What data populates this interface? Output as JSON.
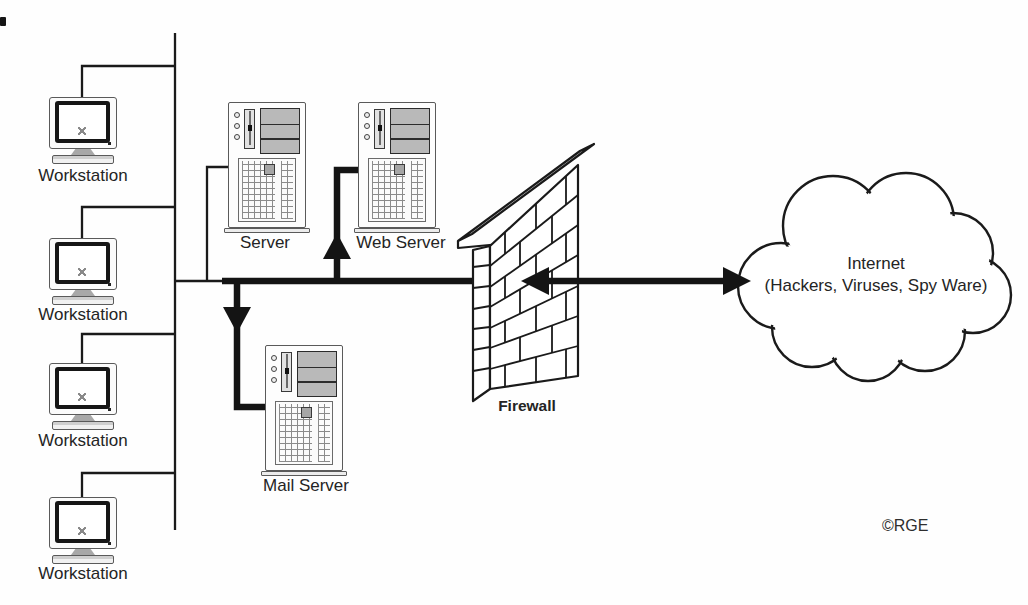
{
  "nodes": {
    "workstations": [
      {
        "label": "Workstation"
      },
      {
        "label": "Workstation"
      },
      {
        "label": "Workstation"
      },
      {
        "label": "Workstation"
      }
    ],
    "server": {
      "label": "Server"
    },
    "web_server": {
      "label": "Web Server"
    },
    "mail_server": {
      "label": "Mail Server"
    },
    "firewall": {
      "label": "Firewall"
    },
    "internet": {
      "line1": "Internet",
      "line2": "(Hackers, Viruses, Spy Ware)"
    }
  },
  "credit": "©RGE",
  "icons": {
    "workstation": "crt-monitor-icon",
    "server": "server-tower-icon",
    "firewall": "brick-wall-icon",
    "internet": "cloud-icon"
  },
  "colors": {
    "line": "#1a1a1a",
    "label": "#242424",
    "icon_gray": "#b9b9b9",
    "background": "#ffffff"
  }
}
